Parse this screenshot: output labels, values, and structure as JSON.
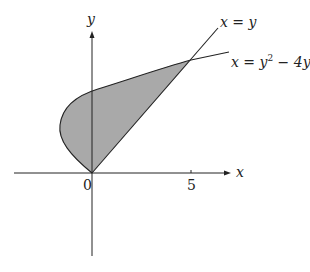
{
  "diagram": {
    "type": "region-between-curves",
    "axes": {
      "x_label": "x",
      "y_label": "y",
      "origin_label": "0",
      "x_tick_label": "5"
    },
    "curves": [
      {
        "name": "line",
        "label": "x = y"
      },
      {
        "name": "parabola",
        "label_prefix": "x = y",
        "label_exp": "2",
        "label_suffix": " − 4y"
      }
    ],
    "region": {
      "fill": "#a9a9a9",
      "description": "shaded region between x = y and x = y^2 - 4y, from (0,0) to (5,5)"
    },
    "colors": {
      "stroke": "#222222",
      "fill": "#a9a9a9"
    }
  }
}
